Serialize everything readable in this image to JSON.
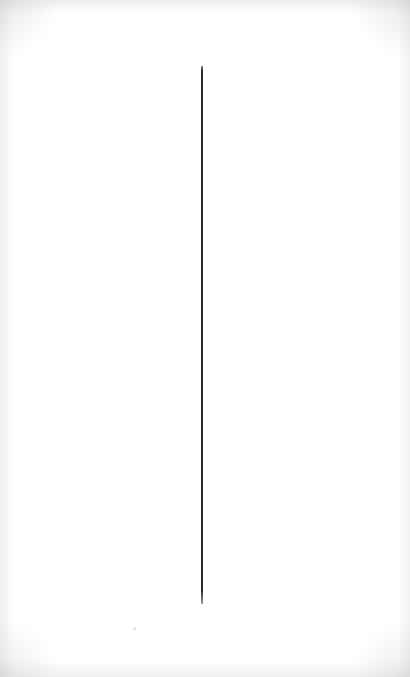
{
  "canvas": {
    "width": 410,
    "height": 677,
    "background_color": "#ffffff",
    "description": "Blank white sheet with a single thin vertical line"
  },
  "marks": {
    "vertical_rule": {
      "name": "vertical-rule",
      "color": "#2a2a2e",
      "x": 202,
      "top": 66,
      "bottom": 604,
      "length": 538,
      "thickness": 1.6,
      "orientation": "vertical"
    },
    "speck": {
      "name": "paper-speck",
      "color": "#d6d6da",
      "x": 134,
      "y": 628
    }
  },
  "scan_artifacts": {
    "edge_shadow_color": "#c4c4c8",
    "corner_shadow_color": "#bcbcc2"
  },
  "text": {
    "none": ""
  }
}
